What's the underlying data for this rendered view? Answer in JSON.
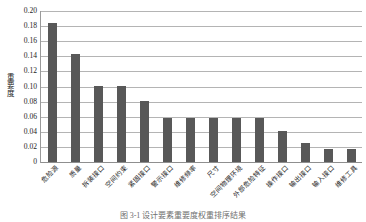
{
  "chart_data": {
    "type": "bar",
    "title": "",
    "xlabel": "",
    "ylabel": "重要度",
    "ylim": [
      0,
      0.2
    ],
    "ytick_labels": [
      "0.20",
      "0.18",
      "0.16",
      "0.14",
      "0.12",
      "0.10",
      "0.08",
      "0.06",
      "0.04",
      "0.02",
      "0"
    ],
    "ytick_values": [
      0.2,
      0.18,
      0.16,
      0.14,
      0.12,
      0.1,
      0.08,
      0.06,
      0.04,
      0.02,
      0
    ],
    "grid": true,
    "legend": "none",
    "bar_color": "#585858",
    "categories": [
      "危险源",
      "质量",
      "拆装接口",
      "空间约束",
      "紧固接口",
      "警示接口",
      "维修频率",
      "尺寸",
      "空间物理环境",
      "外部危险特征",
      "操作接口",
      "输出接口",
      "输入接口",
      "维修工具"
    ],
    "values": [
      0.184,
      0.143,
      0.101,
      0.101,
      0.081,
      0.058,
      0.058,
      0.058,
      0.058,
      0.058,
      0.041,
      0.025,
      0.017,
      0.017
    ]
  },
  "caption": {
    "text": "图 3-1    设计要素重要度权重排序结果"
  }
}
